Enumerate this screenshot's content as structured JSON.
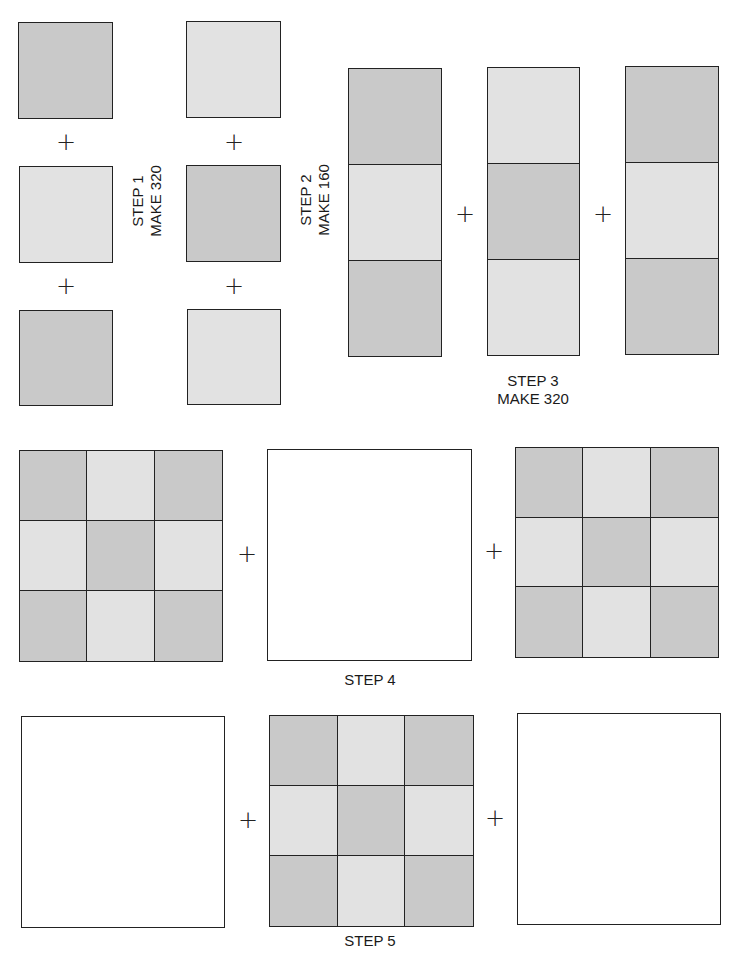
{
  "colors": {
    "dark": "#c9c9c9",
    "light": "#e2e2e2",
    "white": "#ffffff",
    "line": "#222222"
  },
  "plus_sign": "+",
  "step1": {
    "label_line1": "STEP 1",
    "label_line2": "MAKE 320",
    "squares": [
      "dark",
      "light",
      "dark"
    ]
  },
  "step2": {
    "label_line1": "STEP 2",
    "label_line2": "MAKE 160",
    "squares": [
      "light",
      "dark",
      "light"
    ]
  },
  "step3": {
    "label_line1": "STEP 3",
    "label_line2": "MAKE 320",
    "strips": [
      [
        "dark",
        "light",
        "dark"
      ],
      [
        "light",
        "dark",
        "light"
      ],
      [
        "dark",
        "light",
        "dark"
      ]
    ]
  },
  "step4": {
    "label": "STEP 4",
    "blocks": [
      "nine-patch",
      "plain-white",
      "nine-patch"
    ]
  },
  "step5": {
    "label": "STEP 5",
    "blocks": [
      "plain-white",
      "nine-patch",
      "plain-white"
    ]
  }
}
